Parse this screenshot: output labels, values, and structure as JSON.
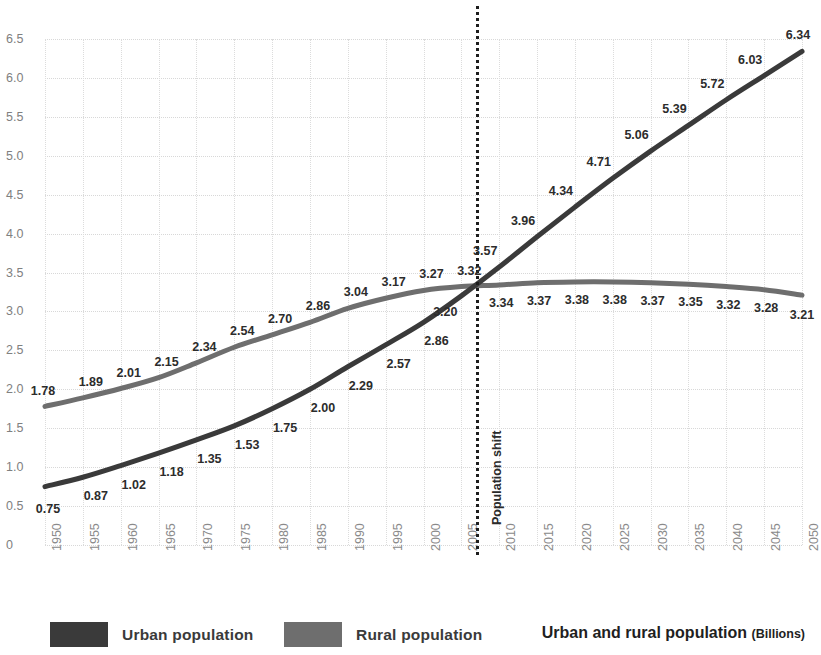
{
  "chart_data": {
    "type": "line",
    "title": "Urban and  rural population",
    "title_unit": "(Billions)",
    "xlabel": "",
    "ylabel": "",
    "ylim": [
      0,
      6.5
    ],
    "ytick_step": 0.5,
    "grid": true,
    "legend_position": "bottom-left",
    "categories": [
      "1950",
      "1955",
      "1960",
      "1965",
      "1970",
      "1975",
      "1980",
      "1985",
      "1990",
      "1995",
      "2000",
      "2005",
      "2010",
      "2015",
      "2020",
      "2025",
      "2030",
      "2035",
      "2040",
      "2045",
      "2050"
    ],
    "ytick_labels": [
      "0",
      "0.5",
      "1.0",
      "1.5",
      "2.0",
      "2.5",
      "3.0",
      "3.5",
      "4.0",
      "4.5",
      "5.0",
      "5.5",
      "6.0",
      "6.5"
    ],
    "ytick_values": [
      0,
      0.5,
      1.0,
      1.5,
      2.0,
      2.5,
      3.0,
      3.5,
      4.0,
      4.5,
      5.0,
      5.5,
      6.0,
      6.5
    ],
    "series": [
      {
        "name": "Urban population",
        "color": "#3a3a3a",
        "values": [
          0.75,
          0.87,
          1.02,
          1.18,
          1.35,
          1.53,
          1.75,
          2.0,
          2.29,
          2.57,
          2.86,
          3.2,
          3.57,
          3.96,
          4.34,
          4.71,
          5.06,
          5.39,
          5.72,
          6.03,
          6.34
        ],
        "labels": [
          "0.75",
          "0.87",
          "1.02",
          "1.18",
          "1.35",
          "1.53",
          "1.75",
          "2.00",
          "2.29",
          "2.57",
          "2.86",
          "3.20",
          "3.57",
          "3.96",
          "4.34",
          "4.71",
          "5.06",
          "5.39",
          "5.72",
          "6.03",
          "6.34"
        ]
      },
      {
        "name": "Rural population",
        "color": "#6e6e6e",
        "values": [
          1.78,
          1.89,
          2.01,
          2.15,
          2.34,
          2.54,
          2.7,
          2.86,
          3.04,
          3.17,
          3.27,
          3.32,
          3.34,
          3.37,
          3.38,
          3.38,
          3.37,
          3.35,
          3.32,
          3.28,
          3.21
        ],
        "labels": [
          "1.78",
          "1.89",
          "2.01",
          "2.15",
          "2.34",
          "2.54",
          "2.70",
          "2.86",
          "3.04",
          "3.17",
          "3.27",
          "3.32",
          "3.34",
          "3.37",
          "3.38",
          "3.38",
          "3.37",
          "3.35",
          "3.32",
          "3.28",
          "3.21"
        ]
      }
    ],
    "annotations": [
      {
        "text": "Population shift",
        "x_value": 2007,
        "style": "vertical-dotted-line"
      }
    ]
  },
  "legend": {
    "items": [
      {
        "label": "Urban population",
        "color": "#3a3a3a"
      },
      {
        "label": "Rural population",
        "color": "#6e6e6e"
      }
    ]
  }
}
